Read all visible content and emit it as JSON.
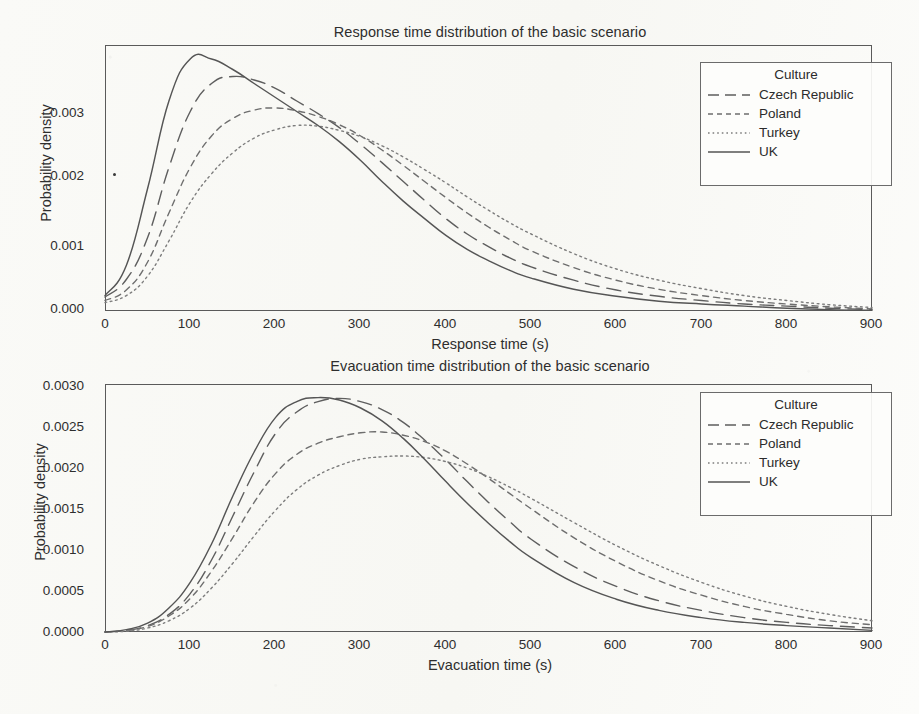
{
  "figure": {
    "background_color": "#fbfbf9",
    "ink_color": "#4a4a4a"
  },
  "legend": {
    "title": "Culture",
    "entries": [
      {
        "label": "Czech Republic",
        "style": "long-dash",
        "color": "#5e5e5e"
      },
      {
        "label": "Poland",
        "style": "short-dash",
        "color": "#6e6e6e"
      },
      {
        "label": "Turkey",
        "style": "dotted",
        "color": "#7d7d7d"
      },
      {
        "label": "UK",
        "style": "solid",
        "color": "#555555"
      }
    ]
  },
  "panels": {
    "response": {
      "title": "Response time distribution of the basic scenario",
      "xlabel": "Response time (s)",
      "ylabel": "Probability density",
      "xticks": [
        "0",
        "100",
        "200",
        "300",
        "400",
        "500",
        "600",
        "700",
        "800",
        "900"
      ],
      "yticks": [
        "0.000",
        "0.001",
        "0.002",
        "0.003"
      ]
    },
    "evacuation": {
      "title": "Evacuation time distribution of the basic scenario",
      "xlabel": "Evacuation time (s)",
      "ylabel": "Probability density",
      "xticks": [
        "0",
        "100",
        "200",
        "300",
        "400",
        "500",
        "600",
        "700",
        "800",
        "900"
      ],
      "yticks": [
        "0.0000",
        "0.0005",
        "0.0010",
        "0.0015",
        "0.0020",
        "0.0025",
        "0.0030"
      ]
    }
  },
  "chart_data": [
    {
      "type": "line",
      "title": "Response time distribution of the basic scenario",
      "xlabel": "Response time (s)",
      "ylabel": "Probability density",
      "xlim": [
        0,
        900
      ],
      "ylim": [
        0,
        0.0038
      ],
      "xticks": [
        0,
        100,
        200,
        300,
        400,
        500,
        600,
        700,
        800,
        900
      ],
      "yticks": [
        0.0,
        0.001,
        0.002,
        0.003
      ],
      "grid": false,
      "legend_title": "Culture",
      "legend_position": "top-right inside",
      "x": [
        0,
        25,
        50,
        75,
        100,
        125,
        150,
        175,
        200,
        225,
        250,
        275,
        300,
        325,
        350,
        375,
        400,
        425,
        450,
        475,
        500,
        550,
        600,
        650,
        700,
        750,
        800,
        850,
        900
      ],
      "series": [
        {
          "name": "Czech Republic",
          "linestyle": "long-dash",
          "peak_x": 145,
          "peak_y": 0.00335,
          "values": [
            0.0002,
            0.00045,
            0.00105,
            0.00205,
            0.00285,
            0.00325,
            0.00335,
            0.0033,
            0.00318,
            0.003,
            0.00282,
            0.00262,
            0.00238,
            0.00212,
            0.00185,
            0.00158,
            0.00132,
            0.0011,
            0.00092,
            0.00076,
            0.00063,
            0.00044,
            0.0003,
            0.00021,
            0.00015,
            0.0001,
            7e-05,
            4e-05,
            2e-05
          ]
        },
        {
          "name": "Poland",
          "linestyle": "short-dash",
          "peak_x": 190,
          "peak_y": 0.0029,
          "values": [
            0.00015,
            0.0003,
            0.0007,
            0.0014,
            0.00205,
            0.0025,
            0.00275,
            0.00287,
            0.0029,
            0.00286,
            0.00278,
            0.00266,
            0.0025,
            0.0023,
            0.00208,
            0.00185,
            0.00162,
            0.0014,
            0.0012,
            0.00102,
            0.00086,
            0.00062,
            0.00044,
            0.00031,
            0.00022,
            0.00015,
            0.0001,
            6e-05,
            3e-05
          ]
        },
        {
          "name": "Turkey",
          "linestyle": "dotted",
          "peak_x": 225,
          "peak_y": 0.00265,
          "values": [
            0.00012,
            0.00022,
            0.0005,
            0.001,
            0.00155,
            0.00196,
            0.00226,
            0.00247,
            0.00259,
            0.00265,
            0.00264,
            0.00258,
            0.00249,
            0.00236,
            0.0022,
            0.00202,
            0.00183,
            0.00163,
            0.00144,
            0.00126,
            0.0011,
            0.00082,
            0.0006,
            0.00044,
            0.00032,
            0.00022,
            0.00015,
            9e-05,
            5e-05
          ]
        },
        {
          "name": "UK",
          "linestyle": "solid",
          "peak_x": 110,
          "peak_y": 0.00362,
          "values": [
            0.00022,
            0.00065,
            0.00175,
            0.003,
            0.0036,
            0.0036,
            0.00345,
            0.00325,
            0.00305,
            0.00285,
            0.00265,
            0.00242,
            0.00215,
            0.00185,
            0.00157,
            0.00132,
            0.00108,
            0.00088,
            0.00072,
            0.00058,
            0.00047,
            0.00031,
            0.00021,
            0.00014,
            0.0001,
            7e-05,
            4e-05,
            2e-05,
            1e-05
          ]
        }
      ]
    },
    {
      "type": "line",
      "title": "Evacuation time distribution of the basic scenario",
      "xlabel": "Evacuation time (s)",
      "ylabel": "Probability density",
      "xlim": [
        0,
        900
      ],
      "ylim": [
        0,
        0.0031
      ],
      "xticks": [
        0,
        100,
        200,
        300,
        400,
        500,
        600,
        700,
        800,
        900
      ],
      "yticks": [
        0.0,
        0.0005,
        0.001,
        0.0015,
        0.002,
        0.0025,
        0.003
      ],
      "grid": false,
      "legend_title": "Culture",
      "legend_position": "top-right inside",
      "x": [
        0,
        25,
        50,
        75,
        100,
        125,
        150,
        175,
        200,
        225,
        250,
        275,
        300,
        325,
        350,
        375,
        400,
        425,
        450,
        475,
        500,
        550,
        600,
        650,
        700,
        750,
        800,
        850,
        900
      ],
      "series": [
        {
          "name": "Czech Republic",
          "linestyle": "long-dash",
          "peak_x": 270,
          "peak_y": 0.00292,
          "values": [
            0.0,
            2e-05,
            8e-05,
            0.00022,
            0.00048,
            0.0009,
            0.00145,
            0.002,
            0.00248,
            0.00275,
            0.00288,
            0.00292,
            0.00288,
            0.00278,
            0.00262,
            0.0024,
            0.00215,
            0.00188,
            0.00162,
            0.00138,
            0.00116,
            0.00082,
            0.00057,
            0.00039,
            0.00027,
            0.00018,
            0.00012,
            8e-05,
            5e-05
          ]
        },
        {
          "name": "Poland",
          "linestyle": "short-dash",
          "peak_x": 320,
          "peak_y": 0.0025,
          "values": [
            0.0,
            2e-05,
            7e-05,
            0.0002,
            0.00042,
            0.00076,
            0.00118,
            0.00162,
            0.00198,
            0.00222,
            0.00236,
            0.00244,
            0.00249,
            0.0025,
            0.00246,
            0.00238,
            0.00226,
            0.0021,
            0.00192,
            0.00173,
            0.00154,
            0.00118,
            0.00088,
            0.00064,
            0.00046,
            0.00032,
            0.00022,
            0.00014,
            9e-05
          ]
        },
        {
          "name": "Turkey",
          "linestyle": "dotted",
          "peak_x": 355,
          "peak_y": 0.0022,
          "values": [
            0.0,
            1e-05,
            5e-05,
            0.00014,
            0.0003,
            0.00055,
            0.00086,
            0.0012,
            0.00152,
            0.00178,
            0.00196,
            0.00208,
            0.00216,
            0.00219,
            0.0022,
            0.00218,
            0.00213,
            0.00205,
            0.00194,
            0.00181,
            0.00167,
            0.00137,
            0.00108,
            0.00083,
            0.00062,
            0.00045,
            0.00032,
            0.00022,
            0.00014
          ]
        },
        {
          "name": "UK",
          "linestyle": "solid",
          "peak_x": 245,
          "peak_y": 0.00293,
          "values": [
            0.0,
            3e-05,
            0.00011,
            0.0003,
            0.00062,
            0.0011,
            0.0017,
            0.00225,
            0.00268,
            0.00288,
            0.00293,
            0.0029,
            0.0028,
            0.00264,
            0.00242,
            0.00216,
            0.00188,
            0.00161,
            0.00136,
            0.00113,
            0.00093,
            0.00062,
            0.00041,
            0.00027,
            0.00018,
            0.00012,
            8e-05,
            5e-05,
            2e-05
          ]
        }
      ]
    }
  ]
}
